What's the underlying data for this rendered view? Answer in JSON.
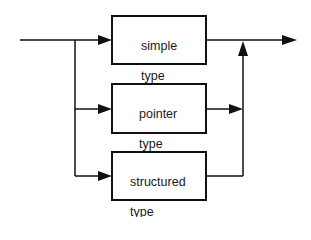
{
  "diagram": {
    "type": "syntax-flow",
    "colors": {
      "stroke": "#111111",
      "background": "#ffffff",
      "text": "#1a1a1a"
    },
    "boxes": [
      {
        "id": "simple",
        "line1": "simple",
        "line2": "type"
      },
      {
        "id": "pointer",
        "line1": "pointer",
        "line2": "type"
      },
      {
        "id": "structured",
        "line1": "structured",
        "line2": "type"
      }
    ]
  }
}
